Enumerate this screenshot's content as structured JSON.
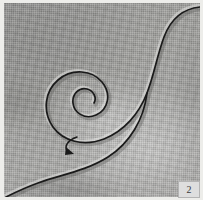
{
  "figure": {
    "number_label": "2",
    "caption_text": "",
    "medium": "woven cloth panel photograph",
    "colors": {
      "cloth_base": "#a4a4a1",
      "cloth_light": "#b6b6b3",
      "cloth_shadow": "#8d8d8b",
      "line_ink": "#1a1a1a",
      "paper_margin": "#ededea",
      "badge_fill": "#dedede",
      "badge_border": "#b4b4b4",
      "badge_text": "#3a3a3a"
    }
  },
  "drawing": {
    "title": "Spiral with sweeping S-curve",
    "elements": [
      {
        "id": "spiral",
        "name": "spiral-curve",
        "description": "Clockwise-inward spiral of about two and a half turns, centered near the middle of the panel",
        "center": [
          96,
          109
        ],
        "turns": 2.5,
        "stroke_color": "#1a1a1a",
        "stroke_width": 1.6
      },
      {
        "id": "sweep",
        "name": "s-sweep-curve",
        "description": "Long S-shaped curve entering at the top-right corner, descending and exiting at the bottom-left corner",
        "stroke_color": "#1a1a1a",
        "stroke_width": 1.6
      },
      {
        "id": "arrowhead",
        "name": "direction-arrowhead",
        "description": "Small solid arrowhead marker below-left of the spiral indicating direction of travel",
        "position": [
          70,
          149
        ],
        "fill_color": "#1a1a1a"
      }
    ]
  }
}
